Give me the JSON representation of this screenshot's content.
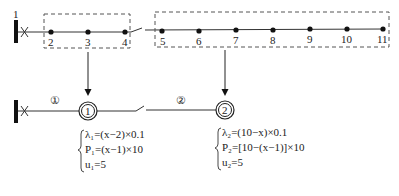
{
  "diagram": {
    "type": "distribution-network-equivalence",
    "top_feeder": {
      "source_label": "1",
      "breaker_symbol": "X",
      "nodes": [
        {
          "id": "2",
          "x": 51
        },
        {
          "id": "3",
          "x": 88
        },
        {
          "id": "4",
          "x": 125
        },
        {
          "id": "5",
          "x": 162
        },
        {
          "id": "6",
          "x": 199
        },
        {
          "id": "7",
          "x": 236
        },
        {
          "id": "8",
          "x": 273
        },
        {
          "id": "9",
          "x": 310
        },
        {
          "id": "10",
          "x": 347
        },
        {
          "id": "11",
          "x": 383
        }
      ],
      "switch_between": [
        "4",
        "5"
      ],
      "groups": [
        {
          "name": "group-1",
          "nodes": [
            "2",
            "3",
            "4"
          ]
        },
        {
          "name": "group-2",
          "nodes": [
            "5",
            "6",
            "7",
            "8",
            "9",
            "10",
            "11"
          ]
        }
      ]
    },
    "bottom_feeder": {
      "breaker_symbol": "X",
      "segments": [
        {
          "label": "①"
        },
        {
          "label": "②"
        }
      ],
      "equivalent_nodes": [
        {
          "label": "1",
          "equations": {
            "lambda": "λ₁=(x−2)×0.1",
            "P": "P₁=(x−1)×10",
            "u": "u₁=5"
          }
        },
        {
          "label": "2",
          "equations": {
            "lambda": "λ₂=(10−x)×0.1",
            "P": "P₂=[10−(x−1)]×10",
            "u": "u₂=5"
          }
        }
      ]
    },
    "colors": {
      "line": "#333333",
      "node": "#111111",
      "dashed_box": "#555555",
      "caption": "#e4e4e4"
    }
  }
}
